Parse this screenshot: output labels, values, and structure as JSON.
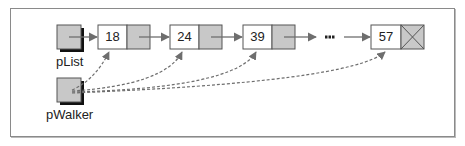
{
  "diagram": {
    "type": "singly-linked-list",
    "pointers": [
      {
        "id": "pList",
        "label": "pList"
      },
      {
        "id": "pWalker",
        "label": "pWalker"
      }
    ],
    "nodes": [
      {
        "value": "18",
        "next": "node"
      },
      {
        "value": "24",
        "next": "node"
      },
      {
        "value": "39",
        "next": "node"
      },
      {
        "value": "57",
        "next": "null"
      }
    ],
    "ellipsis": "•••",
    "edges": [
      {
        "from": "pList",
        "to": "18",
        "style": "solid"
      },
      {
        "from": "18",
        "to": "24",
        "style": "solid"
      },
      {
        "from": "24",
        "to": "39",
        "style": "solid"
      },
      {
        "from": "39",
        "to": "...",
        "style": "solid"
      },
      {
        "from": "...",
        "to": "57",
        "style": "solid"
      },
      {
        "from": "pWalker",
        "to": "18",
        "style": "dashed"
      },
      {
        "from": "pWalker",
        "to": "24",
        "style": "dashed"
      },
      {
        "from": "pWalker",
        "to": "39",
        "style": "dashed"
      },
      {
        "from": "pWalker",
        "to": "57",
        "style": "dashed"
      }
    ],
    "colors": {
      "pointer_fill": "#c8c8c8",
      "node_data_fill": "#ffffff",
      "node_link_fill": "#c8c8c8",
      "border": "#555555",
      "arrow": "#707070",
      "shadow": "#111111"
    }
  }
}
